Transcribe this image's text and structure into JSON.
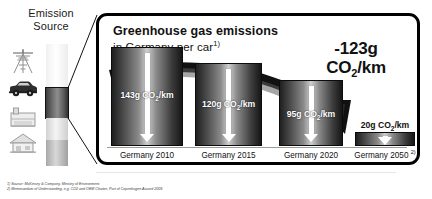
{
  "emission_source": {
    "title_line1": "Emission",
    "title_line2": "Source",
    "icons": [
      {
        "name": "power-tower-icon",
        "label": "Electricity / power transmission"
      },
      {
        "name": "car-icon",
        "label": "Road transport / car"
      },
      {
        "name": "industry-icon",
        "label": "Industry"
      },
      {
        "name": "house-icon",
        "label": "Buildings / households"
      }
    ],
    "highlighted_segment": "car-icon"
  },
  "panel": {
    "title_main": "Greenhouse gas emissions",
    "title_sub": "in Germany per car",
    "title_sub_footnote": "1)",
    "callout_value": "-123g",
    "callout_unit_pre": "CO",
    "callout_unit_sub": "2",
    "callout_unit_post": "/km"
  },
  "chart_data": {
    "type": "bar",
    "title": "Greenhouse gas emissions in Germany per car",
    "xlabel": "",
    "ylabel": "CO2 emissions (g/km)",
    "unit": "g CO2/km",
    "ylim": [
      0,
      150
    ],
    "grid": false,
    "legend": "none",
    "categories": [
      "Germany 2010",
      "Germany 2015",
      "Germany 2020",
      "Germany 2050"
    ],
    "values": [
      143,
      120,
      95,
      20
    ],
    "annotations": [
      "-123g CO2/km"
    ],
    "bars": [
      {
        "category": "Germany 2010",
        "label": "Germany 2010",
        "footnote": "",
        "value": 143,
        "value_pre": "143g CO",
        "value_sub": "2",
        "value_post": "/km",
        "label_inside": true
      },
      {
        "category": "Germany 2015",
        "label": "Germany 2015",
        "footnote": "",
        "value": 120,
        "value_pre": "120g CO",
        "value_sub": "2",
        "value_post": "/km",
        "label_inside": true
      },
      {
        "category": "Germany 2020",
        "label": "Germany 2020",
        "footnote": "",
        "value": 95,
        "value_pre": "95g CO",
        "value_sub": "2",
        "value_post": "/km",
        "label_inside": true
      },
      {
        "category": "Germany 2050",
        "label": "Germany 2050",
        "footnote": "2)",
        "value": 20,
        "value_pre": "20g CO",
        "value_sub": "2",
        "value_post": "/km",
        "label_inside": false
      }
    ]
  },
  "footnotes": [
    "1) Source: McKinsey & Company, Ministry of Environment",
    "2) Memorandum of Understanding, e.g. CO2 and OEM Charter, Part of Copenhagen Accord 2009"
  ],
  "colors": {
    "panel_border": "#000000",
    "background": "#ffffff",
    "bar_dark": "#1f1f1f",
    "bar_light": "#cfcfcf",
    "text": "#111111",
    "arrow": "#ffffff",
    "swoosh": "#000000"
  }
}
